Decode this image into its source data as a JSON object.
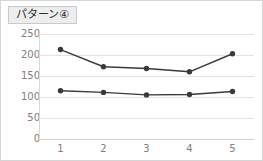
{
  "panel": {
    "title": "パターン④",
    "border_color": "#d6d6d6",
    "background": "#ffffff"
  },
  "chart_data": {
    "type": "line",
    "title": "パターン④",
    "xlabel": "",
    "ylabel": "",
    "categories": [
      "1",
      "2",
      "3",
      "4",
      "5"
    ],
    "series": [
      {
        "name": "series-upper",
        "values": [
          213,
          172,
          168,
          160,
          203
        ],
        "color": "#3a3a3a",
        "marker": "circle"
      },
      {
        "name": "series-lower",
        "values": [
          115,
          111,
          105,
          106,
          113
        ],
        "color": "#3a3a3a",
        "marker": "circle"
      }
    ],
    "ylim": [
      0,
      250
    ],
    "yticks": [
      0,
      50,
      100,
      150,
      200,
      250
    ],
    "ytick_labels": [
      "0",
      "50",
      "100",
      "150",
      "200",
      "250"
    ],
    "grid": true,
    "grid_color": "#e3e3e3",
    "legend": false,
    "legend_position": "none"
  }
}
